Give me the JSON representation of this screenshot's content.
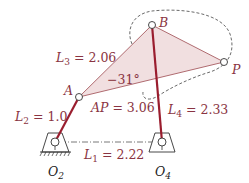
{
  "diagram": {
    "type": "four-bar linkage with coupler point",
    "colors": {
      "link": "#9a1d2e",
      "coupler_edge": "#b06b70",
      "coupler_fill": "#f1dfe0",
      "label": "#8a3442",
      "ground": "#333333",
      "dash": "#444444"
    },
    "points": {
      "O2": {
        "label": "O",
        "sub": "2"
      },
      "O4": {
        "label": "O",
        "sub": "4"
      },
      "A": {
        "label": "A"
      },
      "B": {
        "label": "B"
      },
      "P": {
        "label": "P"
      }
    },
    "labels": {
      "L1": {
        "name": "L",
        "sub": "1",
        "value": " = 2.22"
      },
      "L2": {
        "name": "L",
        "sub": "2",
        "value": " = 1.0"
      },
      "L3": {
        "name": "L",
        "sub": "3",
        "value": " = 2.06"
      },
      "L4": {
        "name": "L",
        "sub": "4",
        "value": " = 2.33"
      },
      "AP": {
        "name": "AP",
        "value": " = 3.06"
      },
      "angle": "−31°"
    }
  }
}
